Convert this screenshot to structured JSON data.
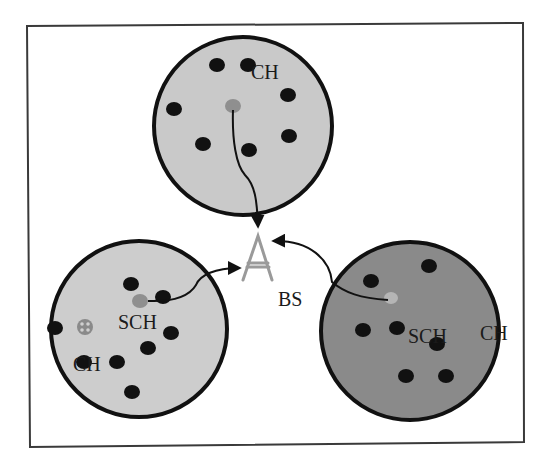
{
  "diagram": {
    "type": "wireless-sensor-network-clustering",
    "colors": {
      "frame": "#3a3a3a",
      "cluster_light": "#c9c9c9",
      "cluster_dark": "#8a8a8a",
      "cluster_border": "#111111",
      "node": "#111111",
      "cluster_head": "#8f8f8f",
      "sub_cluster_head_light": "#b5b5b5",
      "base_station": "#9a9a9a",
      "arrow": "#111111"
    },
    "base_station": {
      "label": "BS",
      "icon": "antenna-tower-icon"
    },
    "clusters": [
      {
        "id": "top",
        "fill": "light",
        "labels": [
          {
            "text": "CH",
            "role": "cluster-head-label"
          }
        ]
      },
      {
        "id": "bottom-left",
        "fill": "light",
        "labels": [
          {
            "text": "SCH",
            "role": "sub-cluster-head-label"
          },
          {
            "text": "CH",
            "role": "cluster-head-label"
          }
        ]
      },
      {
        "id": "bottom-right",
        "fill": "dark",
        "labels": [
          {
            "text": "SCH",
            "role": "sub-cluster-head-label"
          },
          {
            "text": "CH",
            "role": "cluster-head-label"
          }
        ]
      }
    ]
  }
}
